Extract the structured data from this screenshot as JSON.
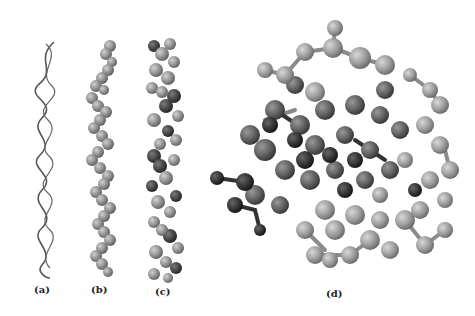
{
  "figure": {
    "panels": [
      {
        "id": "a",
        "label": "(a)",
        "description": "ribbon/wireframe helix rendering"
      },
      {
        "id": "b",
        "label": "(b)",
        "description": "space-filling single strand helix"
      },
      {
        "id": "c",
        "label": "(c)",
        "description": "space-filling double helix"
      },
      {
        "id": "d",
        "label": "(d)",
        "description": "ball-and-stick end-on view"
      }
    ],
    "colors": {
      "light_atom": "#9a9a9a",
      "mid_atom": "#6e6e6e",
      "dark_atom": "#3a3a3a",
      "background": "#ffffff"
    }
  }
}
